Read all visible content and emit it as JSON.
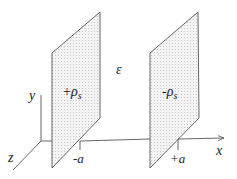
{
  "figure": {
    "type": "parallel charged plates diagram",
    "colors": {
      "line": "#555555",
      "plate_fill": "#f4f4f4",
      "stipple": "#b0b0b0",
      "text": "#222222"
    },
    "axes": {
      "x_label": "x",
      "y_label": "y",
      "z_label": "z"
    },
    "medium_label": "ε",
    "plates": [
      {
        "name": "left-plate",
        "charge_sign": "+",
        "charge_symbol": "ρ",
        "charge_subscript": "s",
        "position_label": "-a"
      },
      {
        "name": "right-plate",
        "charge_sign": "-",
        "charge_symbol": "ρ",
        "charge_subscript": "s",
        "position_label": "+a"
      }
    ]
  }
}
